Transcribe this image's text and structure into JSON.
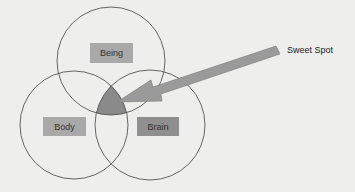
{
  "diagram": {
    "type": "venn",
    "circles": [
      {
        "id": "being",
        "label": "Being",
        "cx": 111,
        "cy": 61,
        "r": 54
      },
      {
        "id": "body",
        "label": "Body",
        "cx": 74,
        "cy": 125,
        "r": 54
      },
      {
        "id": "brain",
        "label": "Brain",
        "cx": 150,
        "cy": 125,
        "r": 55
      }
    ],
    "intersection_label": "Sweet Spot",
    "callout": {
      "text": "Sweet Spot"
    }
  },
  "colors": {
    "background": "#eeeeec",
    "circle_stroke": "#555555",
    "label_box_light": "#a9a9a9",
    "label_box_dark": "#8f8f8f",
    "sweet_spot_fill": "#8a8a8a",
    "arrow_fill": "#9a9a9a"
  }
}
